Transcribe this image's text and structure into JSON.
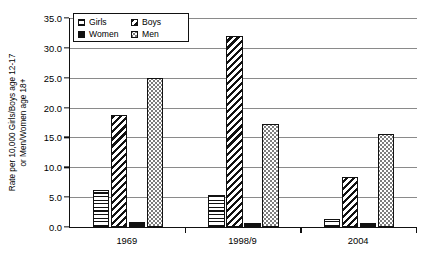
{
  "chart_data": {
    "type": "bar",
    "title": "",
    "xlabel": "",
    "ylabel": "Rate per 10,000 Girls/Boys age 12-17\nor Men/Women age 18+",
    "categories": [
      "1969",
      "1998/9",
      "2004"
    ],
    "series": [
      {
        "name": "Girls",
        "pattern": "horizontal-stripes",
        "values": [
          6.2,
          5.3,
          1.3
        ]
      },
      {
        "name": "Boys",
        "pattern": "diagonal-stripes",
        "values": [
          18.7,
          32.0,
          8.3
        ]
      },
      {
        "name": "Women",
        "pattern": "solid-black",
        "values": [
          0.9,
          0.6,
          0.7
        ]
      },
      {
        "name": "Men",
        "pattern": "dotted",
        "values": [
          25.0,
          17.3,
          15.6
        ]
      }
    ],
    "ylim": [
      0.0,
      35.0
    ],
    "ytick_step": 5.0,
    "yticks": [
      "0.0",
      "5.0",
      "10.0",
      "15.0",
      "20.0",
      "25.0",
      "30.0",
      "35.0"
    ],
    "grid": true,
    "legend_position": "top-left-inside",
    "colors": {
      "ink": "#111111",
      "grid": "#8a8a8a",
      "background": "#ffffff"
    }
  }
}
